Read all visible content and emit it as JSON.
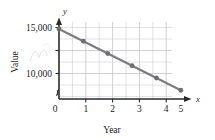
{
  "chart_data": {
    "type": "line",
    "title": "",
    "xlabel": "Year",
    "ylabel": "Value",
    "x": [
      0,
      1,
      2,
      3,
      4,
      5
    ],
    "values": [
      15000,
      13600,
      12200,
      10800,
      9400,
      8000
    ],
    "series": [
      {
        "name": "Value",
        "values": [
          15000,
          13600,
          12200,
          10800,
          9400,
          8000
        ]
      }
    ],
    "xlim": [
      0,
      5.5
    ],
    "ylim": [
      7000,
      15800
    ],
    "xtick_labels": [
      "0",
      "1",
      "2",
      "3",
      "4",
      "5"
    ],
    "ytick_labels": [
      "10,000",
      "15,000"
    ],
    "ytick_values": [
      10000,
      15000
    ],
    "grid": true,
    "grid_minor": true,
    "legend": "none",
    "y_axis_break": true,
    "x_axis_variable": "x",
    "y_axis_variable": "y",
    "line_color": "#7b7b80",
    "marker_color": "#6e6e74",
    "grid_color": "#c9c9cf",
    "axis_color": "#2b2b2b"
  },
  "labels": {
    "y_top": "15,000",
    "y_mid": "10,000",
    "origin": "0",
    "x1": "1",
    "x2": "2",
    "x3": "3",
    "x4": "4",
    "x5": "5",
    "x_axis_title": "Year",
    "y_axis_title": "Value",
    "x_var": "x",
    "y_var": "y"
  }
}
